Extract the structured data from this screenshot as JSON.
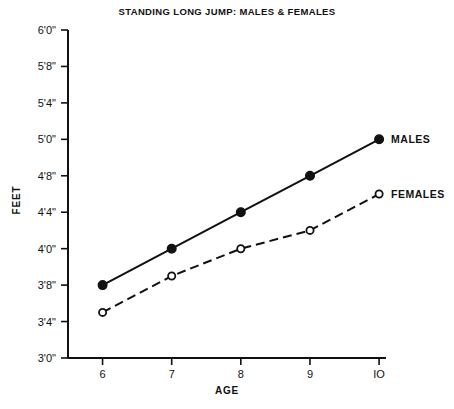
{
  "chart_data": {
    "type": "line",
    "title": "STANDING LONG JUMP: MALES & FEMALES",
    "xlabel": "AGE",
    "ylabel": "FEET",
    "x": [
      6,
      7,
      8,
      9,
      10
    ],
    "xtick_labels": [
      "6",
      "7",
      "8",
      "9",
      "IO"
    ],
    "xlim": [
      5.5,
      10.1
    ],
    "ytick_labels": [
      "3'0\"",
      "3'4\"",
      "3'8\"",
      "4'0\"",
      "4'4\"",
      "4'8\"",
      "5'0\"",
      "5'4\"",
      "5'8\"",
      "6'0\""
    ],
    "ytick_values_inches": [
      36,
      40,
      44,
      48,
      52,
      56,
      60,
      64,
      68,
      72
    ],
    "ylim_inches": [
      36,
      72
    ],
    "grid": false,
    "legend_position": "right-of-line-ends",
    "series": [
      {
        "name": "MALES",
        "label": "MALES",
        "marker": "filled-circle",
        "line_style": "solid",
        "values_inches": [
          44,
          48,
          52,
          56,
          60
        ],
        "values_feet_inches": [
          "3'8\"",
          "4'0\"",
          "4'4\"",
          "4'8\"",
          "5'0\""
        ]
      },
      {
        "name": "FEMALES",
        "label": "FEMALES",
        "marker": "open-circle",
        "line_style": "dashed",
        "values_inches": [
          41,
          45,
          48,
          50,
          54
        ],
        "values_feet_inches": [
          "3'5\"",
          "3'9\"",
          "4'0\"",
          "4'2\"",
          "4'6\""
        ]
      }
    ],
    "colors": {
      "ink": "#111111",
      "background": "#ffffff"
    }
  }
}
